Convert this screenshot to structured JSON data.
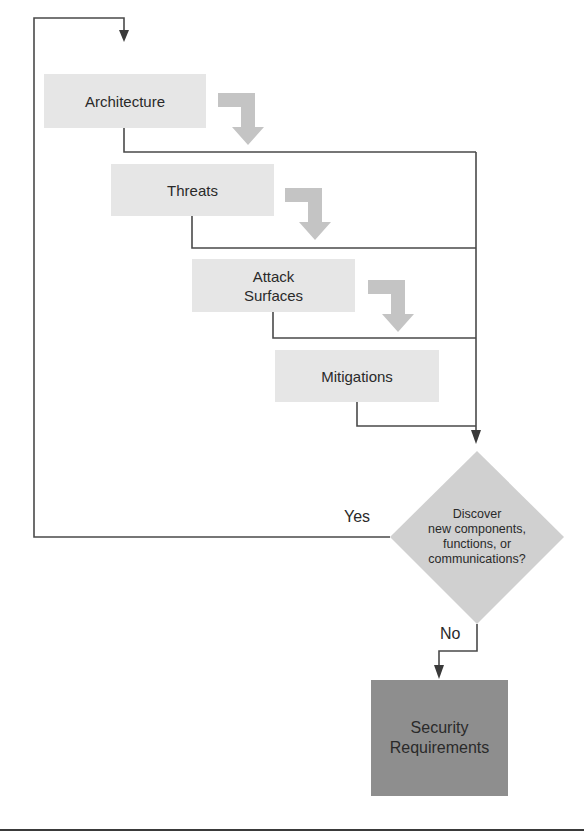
{
  "diagram": {
    "steps": [
      {
        "id": "architecture",
        "label": "Architecture"
      },
      {
        "id": "threats",
        "label": "Threats"
      },
      {
        "id": "attack-surfaces",
        "label_line1": "Attack",
        "label_line2": "Surfaces"
      },
      {
        "id": "mitigations",
        "label": "Mitigations"
      }
    ],
    "decision": {
      "line1": "Discover",
      "line2": "new components,",
      "line3": "functions, or",
      "line4": "communications?"
    },
    "branches": {
      "yes": "Yes",
      "no": "No"
    },
    "outcome": {
      "line1": "Security",
      "line2": "Requirements"
    },
    "colors": {
      "step_fill": "#e6e6e6",
      "decision_fill": "#d0d0d0",
      "outcome_fill": "#8e8e8e",
      "connector": "#4a4a4a",
      "bent_arrow": "#c4c4c4"
    }
  }
}
